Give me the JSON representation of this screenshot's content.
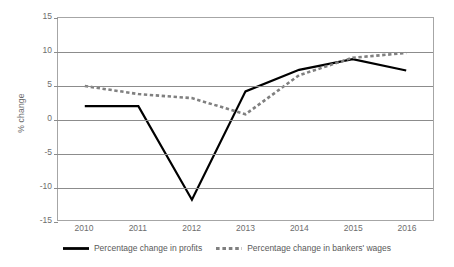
{
  "chart_data": {
    "type": "line",
    "title": "",
    "subtitle": "",
    "xlabel": "",
    "ylabel": "% change",
    "categories": [
      "2010",
      "2011",
      "2012",
      "2013",
      "2014",
      "2015",
      "2016"
    ],
    "x": [
      2010,
      2011,
      2012,
      2013,
      2014,
      2015,
      2016
    ],
    "ylim": [
      -15,
      15
    ],
    "y_ticks": [
      15,
      10,
      5,
      0,
      -5,
      -10,
      -15
    ],
    "y_tick_labels": [
      "15",
      "10",
      "5",
      "0",
      "-5",
      "-10",
      "-15"
    ],
    "grid": true,
    "legend_position": "bottom",
    "series": [
      {
        "name": "Percentage change in profits",
        "style": "solid",
        "color": "#000000",
        "values": [
          1.9,
          1.9,
          -12.0,
          4.1,
          7.3,
          8.9,
          7.2
        ]
      },
      {
        "name": "Percentage change in bankers' wages",
        "style": "dashed",
        "color": "#808080",
        "values": [
          4.9,
          3.7,
          3.1,
          0.7,
          6.5,
          9.1,
          9.8
        ]
      }
    ]
  },
  "legend": {
    "items": [
      {
        "label": "Percentage change in profits",
        "swatch": "solid-line-swatch"
      },
      {
        "label": "Percentage change in bankers' wages",
        "swatch": "dashed-line-swatch"
      }
    ]
  },
  "colors": {
    "profits_line": "#000000",
    "wages_line": "#808080",
    "gridline": "#8c8c8c",
    "axis_border": "#a6a6a6",
    "text": "#6d6d6d",
    "background": "#ffffff"
  }
}
